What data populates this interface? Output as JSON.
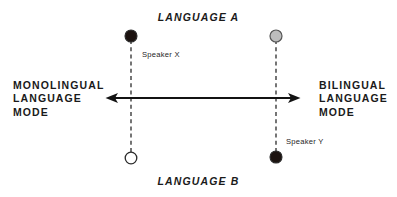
{
  "diagram": {
    "title_top": "LANGUAGE A",
    "title_bottom": "LANGUAGE B",
    "left_mode": "MONOLINGUAL\nLANGUAGE\nMODE",
    "right_mode": "BILINGUAL\nLANGUAGE\nMODE",
    "speaker_x_label": "Speaker X",
    "speaker_y_label": "Speaker Y",
    "colors": {
      "ink": "#1a1a1a",
      "filled_dot": "#1c1310",
      "grey_dot": "#bdbdbd",
      "open_dot": "#ffffff",
      "dot_stroke": "#2b2b2b",
      "background": "#ffffff"
    },
    "axis": {
      "orientation": "horizontal",
      "double_headed": true,
      "left_end_x": 106,
      "right_end_x": 300,
      "y": 98,
      "left_pole": "MONOLINGUAL LANGUAGE MODE",
      "right_pole": "BILINGUAL LANGUAGE MODE",
      "top_pole": "LANGUAGE A",
      "bottom_pole": "LANGUAGE B"
    },
    "speakers": [
      {
        "name": "Speaker X",
        "position_x": 131,
        "language_a_dot": {
          "y": 36,
          "fill": "filled",
          "radius": 6
        },
        "language_b_dot": {
          "y": 158,
          "fill": "open",
          "radius": 6
        }
      },
      {
        "name": "Speaker Y",
        "position_x": 276,
        "language_a_dot": {
          "y": 36,
          "fill": "grey",
          "radius": 6
        },
        "language_b_dot": {
          "y": 157,
          "fill": "filled",
          "radius": 6
        }
      }
    ]
  }
}
